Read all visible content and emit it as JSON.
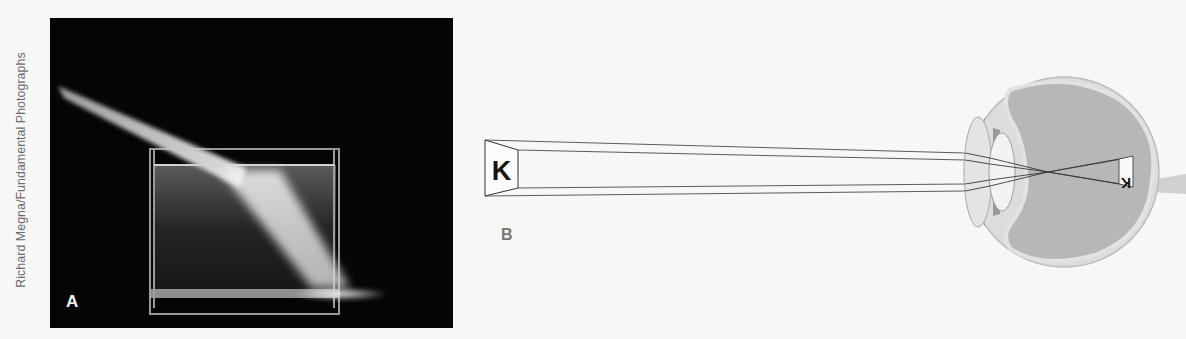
{
  "figure": {
    "photo_credit": "Richard Megna/Fundamental Photographs",
    "panels": [
      {
        "label": "A",
        "description": "Photograph of a light beam refracting as it enters a rectangular tank of water",
        "icon": "light-refraction-photo-icon"
      },
      {
        "label": "B",
        "description": "Diagram of light rays from the letter K passing through the lens of the eye, forming an inverted image on the retina",
        "object_letter": "K",
        "retina_image_letter": "K",
        "retina_image_orientation": "inverted",
        "icon": "eye-cross-section-icon"
      }
    ],
    "colors": {
      "background": "#f7f7f5",
      "photo_background": "#050505",
      "line": "#3a3a3a",
      "eye_fill": "#bdbdbd",
      "eye_wall": "#d8d8d8"
    }
  }
}
